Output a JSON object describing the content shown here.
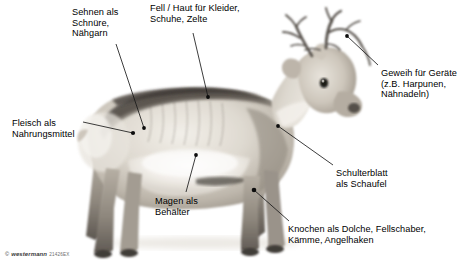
{
  "figure": {
    "width": 467,
    "height": 272,
    "background_color": "#ffffff",
    "line_color": "#1a1a1a",
    "text_color": "#000000"
  },
  "labels": {
    "sehnen": "Sehnen als\nSchnüre,\nNähgarn",
    "fell": "Fell / Haut für Kleider,\nSchuhe, Zelte",
    "geweih": "Geweih für Geräte\n(z.B. Harpunen,\nNähnadeln)",
    "fleisch": "Fleisch als\nNahrungsmittel",
    "magen": "Magen als\nBehälter",
    "schulterblatt": "Schulterblatt\nals Schaufel",
    "knochen": "Knochen als Dolche, Fellschaber,\nKämme, Angelhaken"
  },
  "credit": {
    "mark": "©",
    "brand": "westermann",
    "code": "21426EX"
  }
}
